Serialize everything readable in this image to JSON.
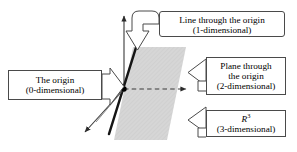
{
  "figure": {
    "colors": {
      "plane_fill": "#d4d4d4",
      "line_stroke": "#111111",
      "axis_stroke": "#3a3a3a",
      "callout_border": "#4a4a4a",
      "background": "#ffffff",
      "origin_dot": "#000000"
    }
  },
  "callouts": {
    "line": {
      "name": "line-through-origin",
      "title": "Line through the origin",
      "subtitle": "(1-dimensional)",
      "arrow_direction": "down"
    },
    "plane": {
      "name": "plane-through-origin",
      "title": "Plane through",
      "title2": "the origin",
      "subtitle": "(2-dimensional)",
      "arrow_direction": "left"
    },
    "r3": {
      "name": "r-three",
      "symbol": "R",
      "exponent": "3",
      "subtitle": "(3-dimensional)",
      "arrow_direction": "left"
    },
    "origin": {
      "name": "the-origin",
      "title": "The origin",
      "subtitle": "(0-dimensional)",
      "arrow_direction": "right"
    }
  },
  "geometry": {
    "origin_point": {
      "x": 124,
      "y": 89
    },
    "axes": [
      {
        "name": "vertical-axis",
        "x1": 124,
        "y1": 89,
        "x2": 124,
        "y2": 14,
        "style": "solid",
        "arrow": true
      },
      {
        "name": "horizontal-axis",
        "x1": 124,
        "y1": 89,
        "x2": 191,
        "y2": 89,
        "style": "dashed",
        "arrow": true
      },
      {
        "name": "depth-axis",
        "x1": 124,
        "y1": 89,
        "x2": 82,
        "y2": 136,
        "style": "solid",
        "arrow": true
      }
    ],
    "plane_polygon": "114,140 133,47 186,47 167,140",
    "subspace_line": {
      "x1": 136,
      "y1": 47,
      "x2": 110,
      "y2": 133
    }
  }
}
